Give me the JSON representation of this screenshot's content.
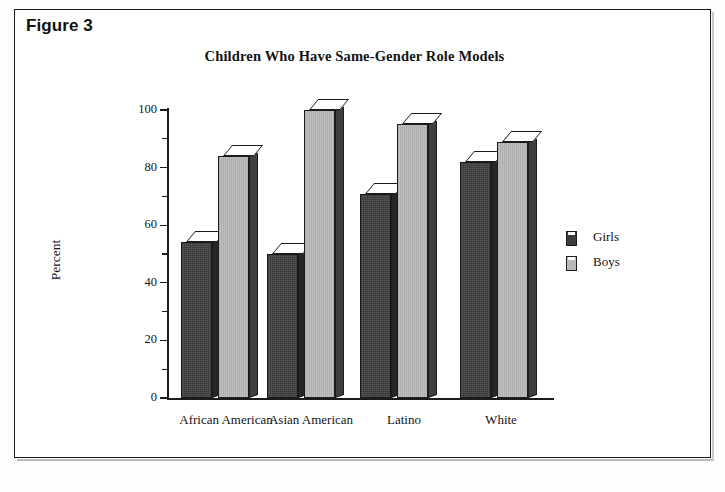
{
  "figure": {
    "label": "Figure 3"
  },
  "chart_data": {
    "type": "bar",
    "title": "Children Who Have Same-Gender Role Models",
    "xlabel": "",
    "ylabel": "Percent",
    "ylim": [
      0,
      100
    ],
    "yticks": [
      0,
      20,
      40,
      60,
      80,
      100
    ],
    "grid": false,
    "legend_position": "right",
    "categories": [
      "African American",
      "Asian American",
      "Latino",
      "White"
    ],
    "series": [
      {
        "name": "Girls",
        "color": "#3c3c3c",
        "values": [
          54,
          50,
          71,
          82
        ]
      },
      {
        "name": "Boys",
        "color": "#b9b9b9",
        "values": [
          84,
          100,
          95,
          89
        ]
      }
    ]
  },
  "legend": {
    "items": [
      {
        "label": "Girls"
      },
      {
        "label": "Boys"
      }
    ]
  }
}
